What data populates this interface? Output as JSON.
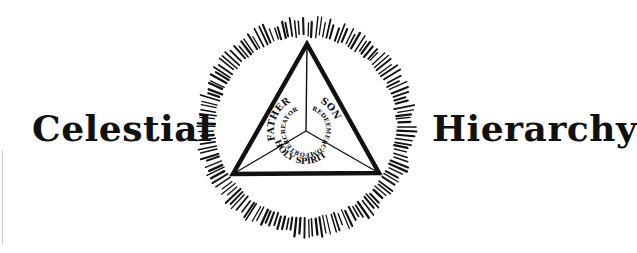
{
  "title": {
    "left_word": "Celestial",
    "right_word": "Hierarchy"
  },
  "emblem": {
    "center": [
      306,
      127
    ],
    "ray_inner_radius": 90,
    "ray_outer_radius": 111,
    "ray_count": 150,
    "triangle": {
      "top": [
        307,
        44
      ],
      "bottom_left": [
        233,
        174
      ],
      "bottom_right": [
        379,
        173
      ],
      "centroid": [
        306,
        131
      ]
    },
    "sections": [
      {
        "name": "FATHER",
        "role": "CREATOR"
      },
      {
        "name": "SON",
        "role": "REDEEMER"
      },
      {
        "name": "HOLY SPIRIT",
        "role": "COMFORTER"
      }
    ]
  },
  "colors": {
    "ink": "#111111",
    "background": "#ffffff"
  }
}
